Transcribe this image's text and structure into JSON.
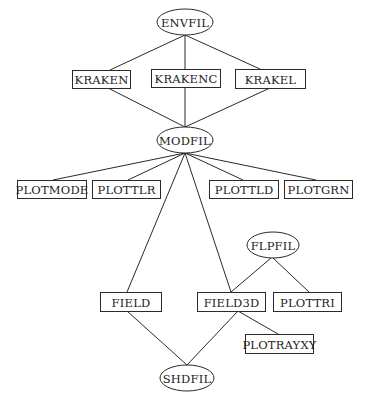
{
  "diagram": {
    "type": "flow-structure",
    "nodes": [
      {
        "id": "ENVFIL",
        "label": "ENVFIL",
        "shape": "ellipse",
        "cx": 185,
        "cy": 22,
        "rx": 28,
        "ry": 13
      },
      {
        "id": "KRAKEN",
        "label": "KRAKEN",
        "shape": "rect",
        "x": 72,
        "y": 70,
        "w": 58,
        "h": 18
      },
      {
        "id": "KRAKENC",
        "label": "KRAKENC",
        "shape": "rect",
        "x": 151,
        "y": 69,
        "w": 69,
        "h": 18
      },
      {
        "id": "KRAKEL",
        "label": "KRAKEL",
        "shape": "rect",
        "x": 235,
        "y": 69,
        "w": 70,
        "h": 19
      },
      {
        "id": "MODFIL",
        "label": "MODFIL",
        "shape": "ellipse",
        "cx": 185,
        "cy": 140,
        "rx": 28,
        "ry": 13
      },
      {
        "id": "PLOTMODE",
        "label": "PLOTMODE",
        "shape": "rect",
        "x": 17,
        "y": 180,
        "w": 69,
        "h": 18
      },
      {
        "id": "PLOTTLR",
        "label": "PLOTTLR",
        "shape": "rect",
        "x": 92,
        "y": 180,
        "w": 68,
        "h": 18
      },
      {
        "id": "PLOTTLD",
        "label": "PLOTTLD",
        "shape": "rect",
        "x": 209,
        "y": 180,
        "w": 69,
        "h": 18
      },
      {
        "id": "PLOTGRN",
        "label": "PLOTGRN",
        "shape": "rect",
        "x": 284,
        "y": 180,
        "w": 68,
        "h": 18
      },
      {
        "id": "FLPFIL",
        "label": "FLPFIL",
        "shape": "ellipse",
        "cx": 273,
        "cy": 245,
        "rx": 26,
        "ry": 13
      },
      {
        "id": "FIELD",
        "label": "FIELD",
        "shape": "rect",
        "x": 100,
        "y": 292,
        "w": 61,
        "h": 19
      },
      {
        "id": "FIELD3D",
        "label": "FIELD3D",
        "shape": "rect",
        "x": 197,
        "y": 292,
        "w": 68,
        "h": 19
      },
      {
        "id": "PLOTTRI",
        "label": "PLOTTRI",
        "shape": "rect",
        "x": 273,
        "y": 292,
        "w": 68,
        "h": 19
      },
      {
        "id": "PLOTRAYXY",
        "label": "PLOTRAYXY",
        "shape": "rect",
        "x": 245,
        "y": 334,
        "w": 68,
        "h": 19
      },
      {
        "id": "SHDFIL",
        "label": "SHDFIL",
        "shape": "ellipse",
        "cx": 187,
        "cy": 378,
        "rx": 27,
        "ry": 13
      }
    ],
    "edges": [
      {
        "from": "ENVFIL",
        "to": "KRAKEN",
        "x1": 185,
        "y1": 35,
        "x2": 110,
        "y2": 70
      },
      {
        "from": "ENVFIL",
        "to": "KRAKENC",
        "x1": 185,
        "y1": 35,
        "x2": 185,
        "y2": 69
      },
      {
        "from": "ENVFIL",
        "to": "KRAKEL",
        "x1": 185,
        "y1": 35,
        "x2": 260,
        "y2": 69
      },
      {
        "from": "KRAKEN",
        "to": "MODFIL",
        "x1": 108,
        "y1": 88,
        "x2": 185,
        "y2": 127
      },
      {
        "from": "KRAKENC",
        "to": "MODFIL",
        "x1": 185,
        "y1": 87,
        "x2": 185,
        "y2": 127
      },
      {
        "from": "KRAKEL",
        "to": "MODFIL",
        "x1": 270,
        "y1": 88,
        "x2": 185,
        "y2": 127
      },
      {
        "from": "MODFIL",
        "to": "PLOTMODE",
        "x1": 185,
        "y1": 153,
        "x2": 53,
        "y2": 180
      },
      {
        "from": "MODFIL",
        "to": "PLOTTLR",
        "x1": 185,
        "y1": 153,
        "x2": 128,
        "y2": 180
      },
      {
        "from": "MODFIL",
        "to": "PLOTTLD",
        "x1": 185,
        "y1": 153,
        "x2": 243,
        "y2": 180
      },
      {
        "from": "MODFIL",
        "to": "PLOTGRN",
        "x1": 185,
        "y1": 153,
        "x2": 316,
        "y2": 180
      },
      {
        "from": "MODFIL",
        "to": "FIELD",
        "x1": 185,
        "y1": 153,
        "x2": 127,
        "y2": 292
      },
      {
        "from": "MODFIL",
        "to": "FIELD3D",
        "x1": 185,
        "y1": 153,
        "x2": 231,
        "y2": 292
      },
      {
        "from": "FLPFIL",
        "to": "FIELD3D",
        "x1": 271,
        "y1": 258,
        "x2": 231,
        "y2": 292
      },
      {
        "from": "FLPFIL",
        "to": "PLOTTRI",
        "x1": 273,
        "y1": 258,
        "x2": 309,
        "y2": 292
      },
      {
        "from": "FIELD3D",
        "to": "PLOTRAYXY",
        "x1": 238,
        "y1": 311,
        "x2": 278,
        "y2": 334
      },
      {
        "from": "FIELD",
        "to": "SHDFIL",
        "x1": 127,
        "y1": 311,
        "x2": 187,
        "y2": 365
      },
      {
        "from": "FIELD3D",
        "to": "SHDFIL",
        "x1": 238,
        "y1": 311,
        "x2": 187,
        "y2": 365
      }
    ]
  }
}
